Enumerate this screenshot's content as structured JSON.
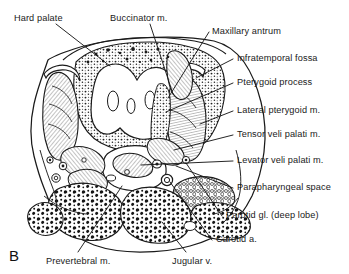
{
  "figure": {
    "panel_letter": "B",
    "caption_labels": [
      {
        "key": "hard_palate",
        "text": "Hard palate",
        "x": 14,
        "y": 14
      },
      {
        "key": "buccinator",
        "text": "Buccinator m.",
        "x": 110,
        "y": 14
      },
      {
        "key": "maxillary_antrum",
        "text": "Maxillary antrum",
        "x": 212,
        "y": 27
      },
      {
        "key": "infratemporal",
        "text": "Infratemporal fossa",
        "x": 237,
        "y": 54
      },
      {
        "key": "pterygoid_process",
        "text": "Pterygoid process",
        "x": 237,
        "y": 78
      },
      {
        "key": "lateral_pterygoid",
        "text": "Lateral pterygoid m.",
        "x": 237,
        "y": 106
      },
      {
        "key": "tensor_veli",
        "text": "Tensor veli palati m.",
        "x": 237,
        "y": 130
      },
      {
        "key": "levator_veli",
        "text": "Levator veli palati m.",
        "x": 237,
        "y": 156
      },
      {
        "key": "parapharyngeal",
        "text": "Parapharyngeal space",
        "x": 237,
        "y": 183
      },
      {
        "key": "parotid_deep_lobe",
        "text": "Parotid gl. (deep lobe)",
        "x": 226,
        "y": 211
      },
      {
        "key": "carotid_a",
        "text": "Carotid a.",
        "x": 216,
        "y": 235
      },
      {
        "key": "jugular_v",
        "text": "Jugular v.",
        "x": 172,
        "y": 257
      },
      {
        "key": "prevertebral",
        "text": "Prevertebral m.",
        "x": 46,
        "y": 257
      }
    ],
    "colors": {
      "ink": "#1a1a1a",
      "background": "#ffffff",
      "tissue_shade": "#b9b9b9",
      "muscle_hatch": "#8f8f8f"
    }
  }
}
